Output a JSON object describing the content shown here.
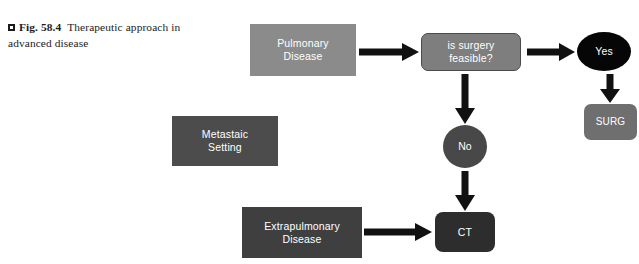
{
  "figure": {
    "caption_marker_icon": "filled-square-marker-icon",
    "caption_label": "Fig. 58.4",
    "caption_text": "Therapeutic approach in advanced disease"
  },
  "diagram": {
    "nodes": [
      {
        "id": "pulmonary",
        "label": "Pulmonary\nDisease",
        "shape": "rect",
        "color": "#8b8b8b"
      },
      {
        "id": "metastaic",
        "label": "Metastaic\nSetting",
        "shape": "rect",
        "color": "#4c4c4c"
      },
      {
        "id": "extrapulmonary",
        "label": "Extrapulmonary\nDisease",
        "shape": "rect",
        "color": "#3f3f3f"
      },
      {
        "id": "decision",
        "label": "is surgery\nfeasible?",
        "shape": "rounded-rect",
        "color": "#7e7e7e"
      },
      {
        "id": "yes",
        "label": "Yes",
        "shape": "ellipse",
        "color": "#060606"
      },
      {
        "id": "no",
        "label": "No",
        "shape": "ellipse",
        "color": "#484848"
      },
      {
        "id": "surg",
        "label": "SURG",
        "shape": "rounded-rect",
        "color": "#6f6f6f"
      },
      {
        "id": "ct",
        "label": "CT",
        "shape": "rounded-rect",
        "color": "#2d2d2d"
      }
    ],
    "edges": [
      {
        "id": "pulmonary-to-decision",
        "from": "pulmonary",
        "to": "decision",
        "direction": "right"
      },
      {
        "id": "decision-to-yes",
        "from": "decision",
        "to": "yes",
        "direction": "right"
      },
      {
        "id": "decision-to-no",
        "from": "decision",
        "to": "no",
        "direction": "down"
      },
      {
        "id": "yes-to-surg",
        "from": "yes",
        "to": "surg",
        "direction": "down"
      },
      {
        "id": "no-to-ct",
        "from": "no",
        "to": "ct",
        "direction": "down"
      },
      {
        "id": "extrapulmonary-to-ct",
        "from": "extrapulmonary",
        "to": "ct",
        "direction": "right"
      }
    ],
    "arrow_color": "#111111"
  }
}
